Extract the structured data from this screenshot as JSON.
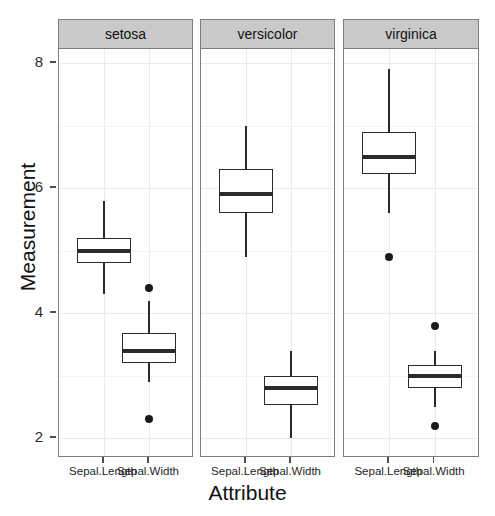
{
  "chart_data": {
    "type": "boxplot",
    "title": "",
    "xlabel": "Attribute",
    "ylabel": "Measurement",
    "ylim": [
      1.72,
      8.27
    ],
    "yticks": [
      2,
      4,
      6,
      8
    ],
    "ytick_labels": [
      "2",
      "4",
      "6",
      "8"
    ],
    "grid": true,
    "legend": "none",
    "facet_variable": "Species",
    "facets": [
      "setosa",
      "versicolor",
      "virginica"
    ],
    "categories": [
      "Sepal.Length",
      "Sepal.Width"
    ],
    "groups": [
      {
        "facet": "setosa",
        "boxes": [
          {
            "category": "Sepal.Length",
            "min_whisker": 4.3,
            "q1": 4.8,
            "median": 5.0,
            "q3": 5.2,
            "max_whisker": 5.8,
            "outliers": []
          },
          {
            "category": "Sepal.Width",
            "min_whisker": 2.9,
            "q1": 3.2,
            "median": 3.4,
            "q3": 3.675,
            "max_whisker": 4.2,
            "outliers": [
              4.4,
              2.3
            ]
          }
        ]
      },
      {
        "facet": "versicolor",
        "boxes": [
          {
            "category": "Sepal.Length",
            "min_whisker": 4.9,
            "q1": 5.6,
            "median": 5.9,
            "q3": 6.3,
            "max_whisker": 7.0,
            "outliers": []
          },
          {
            "category": "Sepal.Width",
            "min_whisker": 2.0,
            "q1": 2.525,
            "median": 2.8,
            "q3": 3.0,
            "max_whisker": 3.4,
            "outliers": []
          }
        ]
      },
      {
        "facet": "virginica",
        "boxes": [
          {
            "category": "Sepal.Length",
            "min_whisker": 5.6,
            "q1": 6.225,
            "median": 6.5,
            "q3": 6.9,
            "max_whisker": 7.9,
            "outliers": [
              4.9
            ]
          },
          {
            "category": "Sepal.Width",
            "min_whisker": 2.5,
            "q1": 2.8,
            "median": 3.0,
            "q3": 3.175,
            "max_whisker": 3.4,
            "outliers": [
              3.8,
              2.2
            ]
          }
        ]
      }
    ]
  },
  "axes": {
    "y_title": "Measurement",
    "x_title": "Attribute"
  },
  "colors": {
    "panel_background": "#ffffff",
    "panel_border": "#7d7d7d",
    "strip_background": "#c9c9c9",
    "gridline": "#ebebeb",
    "box_stroke": "#2b2b2b",
    "outlier_fill": "#1a1a1a",
    "text": "#111111"
  },
  "layout": {
    "panel_top": 48,
    "panel_bottom": 457,
    "panels_x": [
      [
        58,
        193
      ],
      [
        200,
        335
      ],
      [
        343,
        479
      ]
    ],
    "y_pixel_for_value": {
      "2": 437,
      "4": 312,
      "6": 187,
      "8": 62
    }
  }
}
